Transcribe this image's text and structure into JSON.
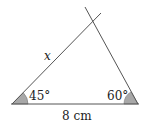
{
  "diagram": {
    "type": "triangle",
    "labels": {
      "side_left": "x",
      "base": "8 cm",
      "angle_left": "45°",
      "angle_right": "60°"
    },
    "colors": {
      "line": "#555555",
      "angle_fill": "#a8a8a8",
      "text": "#222222"
    }
  }
}
